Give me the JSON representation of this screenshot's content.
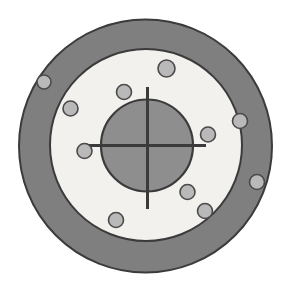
{
  "figure": {
    "type": "technical-line-drawing",
    "canvas": {
      "width": 289,
      "height": 281,
      "background": "#ffffff"
    },
    "colors": {
      "background": "#ffffff",
      "outer_ring_fill": "#7f7f7f",
      "outer_ring_stroke": "#3b3b3b",
      "inner_face_fill": "#f2f1ee",
      "inner_face_stroke": "#3b3b3b",
      "hub_fill": "#8e8e8e",
      "hub_stroke": "#3b3b3b",
      "hole_fill": "#b9b9b9",
      "hole_stroke": "#4a4a4a",
      "crosshair_stroke": "#3b3b3b"
    },
    "parts": {
      "outer_ring": {
        "label": "outer-ring",
        "cx": 145.5,
        "cy": 146.0,
        "r": 126.5,
        "stroke_width": 2.0
      },
      "inner_face": {
        "label": "inner-face",
        "cx": 146.0,
        "cy": 145.0,
        "r": 96.0,
        "stroke_width": 2.0
      },
      "hub": {
        "label": "center-hub",
        "cx": 147.0,
        "cy": 145.5,
        "r": 46.0,
        "stroke_width": 2.2
      },
      "crosshair": {
        "label": "center-crosshair",
        "stroke_width": 3.0,
        "horizontal": {
          "x1": 88.0,
          "y1": 145.5,
          "x2": 206.0,
          "y2": 145.5
        },
        "vertical": {
          "x1": 147.5,
          "y1": 87.0,
          "x2": 147.5,
          "y2": 209.0
        }
      }
    },
    "bolt_holes": [
      {
        "id": "hole-1",
        "zone": "outer-ring",
        "cx": 44.0,
        "cy": 82.0,
        "r": 7.0
      },
      {
        "id": "hole-2",
        "zone": "inner-face",
        "cx": 70.5,
        "cy": 108.5,
        "r": 7.5
      },
      {
        "id": "hole-3",
        "zone": "inner-face",
        "cx": 124.0,
        "cy": 92.0,
        "r": 7.5
      },
      {
        "id": "hole-4",
        "zone": "inner-face",
        "cx": 166.5,
        "cy": 68.5,
        "r": 8.5
      },
      {
        "id": "hole-5",
        "zone": "outer-ring",
        "cx": 240.0,
        "cy": 121.0,
        "r": 7.5
      },
      {
        "id": "hole-6",
        "zone": "inner-face",
        "cx": 208.0,
        "cy": 134.5,
        "r": 7.5
      },
      {
        "id": "hole-7",
        "zone": "outer-ring",
        "cx": 257.0,
        "cy": 182.0,
        "r": 7.5
      },
      {
        "id": "hole-8",
        "zone": "inner-face",
        "cx": 187.5,
        "cy": 192.0,
        "r": 7.5
      },
      {
        "id": "hole-9",
        "zone": "inner-face",
        "cx": 205.0,
        "cy": 211.0,
        "r": 7.5
      },
      {
        "id": "hole-10",
        "zone": "inner-face",
        "cx": 116.0,
        "cy": 220.0,
        "r": 7.5
      },
      {
        "id": "hole-11",
        "zone": "inner-face",
        "cx": 84.5,
        "cy": 151.0,
        "r": 7.5
      }
    ]
  }
}
